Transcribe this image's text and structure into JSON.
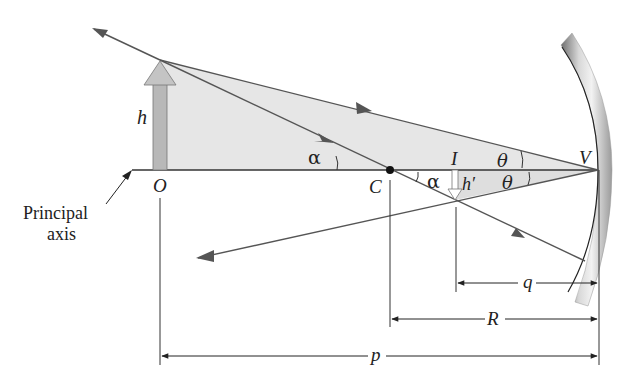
{
  "diagram": {
    "labels": {
      "object_height": "h",
      "object_point": "O",
      "center_of_curvature": "C",
      "image_point": "I",
      "image_height": "h′",
      "vertex": "V",
      "angle_alpha_1": "α",
      "angle_alpha_2": "α",
      "angle_theta_1": "θ",
      "angle_theta_2": "θ",
      "image_distance": "q",
      "radius": "R",
      "object_distance": "p",
      "principal_axis_line1": "Principal",
      "principal_axis_line2": "axis"
    },
    "colors": {
      "ray": "#555555",
      "shade": "#e4e4e4",
      "arrow_fill": "#b8b8b8",
      "axis": "#333333",
      "mirror_dark": "#8a8a8a",
      "mirror_light": "#e8e8e8"
    }
  }
}
